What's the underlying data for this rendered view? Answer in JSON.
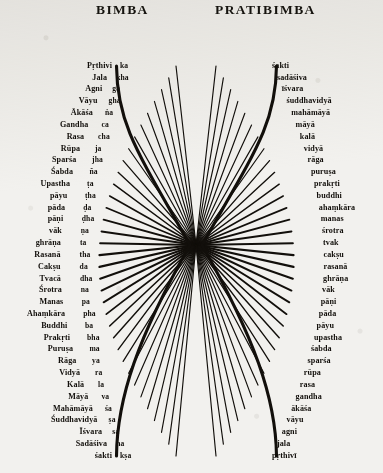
{
  "figure": {
    "left_heading": "BIMBA",
    "right_heading": "PRATIBIMBA",
    "ink_color": "#120f0b",
    "paper_color": "#f2f1ee",
    "ray_count": 36,
    "center_x": 196,
    "center_y": 245
  },
  "bimba": {
    "tattvas": [
      "Pṛthivi",
      "Jala",
      "Agni",
      "Vāyu",
      "Ākāśa",
      "Gandha",
      "Rasa",
      "Rūpa",
      "Sparśa",
      "Śabda",
      "Upastha",
      "pāyu",
      "pāda",
      "pāṇi",
      "vāk",
      "ghrāṇa",
      "Rasanā",
      "Cakṣu",
      "Tvacā",
      "Śrotra",
      "Manas",
      "Ahaṃkāra",
      "Buddhi",
      "Prakṛti",
      "Puruṣa",
      "Rāga",
      "Vidyā",
      "Kalā",
      "Māyā",
      "Mahāmāyā",
      "Śuddhavidyā",
      "Īśvara",
      "Sadāśiva",
      "śakti"
    ],
    "letters": [
      "ka",
      "kha",
      "ga",
      "gha",
      "ṅa",
      "ca",
      "cha",
      "ja",
      "jha",
      "ña",
      "ṭa",
      "ṭha",
      "ḍa",
      "ḍha",
      "ṇa",
      "ta",
      "tha",
      "da",
      "dha",
      "na",
      "pa",
      "pha",
      "ba",
      "bha",
      "ma",
      "ya",
      "ra",
      "la",
      "va",
      "śa",
      "ṣa",
      "sa",
      "ha",
      "kṣa"
    ]
  },
  "pratibimba": {
    "tattvas": [
      "śakti",
      "sadāśiva",
      "īśvara",
      "śuddhavidyā",
      "mahāmāyā",
      "māyā",
      "kalā",
      "vidyā",
      "rāga",
      "puruṣa",
      "prakṛti",
      "buddhi",
      "ahaṃkāra",
      "manas",
      "śrotra",
      "tvak",
      "cakṣu",
      "rasanā",
      "ghrāṇa",
      "vāk",
      "pāṇi",
      "pāda",
      "pāyu",
      "upastha",
      "śabda",
      "sparśa",
      "rūpa",
      "rasa",
      "gandha",
      "ākāśa",
      "vāyu",
      "agni",
      "jala",
      "pṛthivī"
    ]
  }
}
